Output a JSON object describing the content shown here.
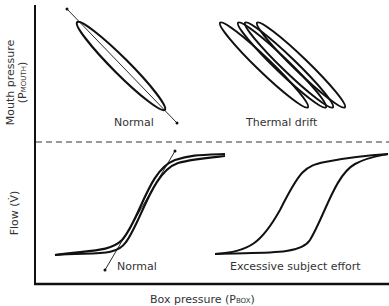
{
  "y_axis_top": {
    "label": "Mouth pressure",
    "symbol_main": "(P",
    "symbol_sub": "MOUTH",
    "symbol_end": ")"
  },
  "y_axis_bottom": {
    "label": "Flow (V̇)"
  },
  "x_axis": {
    "label_partial": "Box pressure",
    "symbol_main": "(P",
    "symbol_sub": "BOX",
    "symbol_end": ")"
  },
  "panels": {
    "top_left": {
      "caption": "Normal"
    },
    "top_right": {
      "caption": "Thermal drift"
    },
    "bottom_left": {
      "caption": "Normal"
    },
    "bottom_right": {
      "caption": "Excessive subject effort"
    }
  },
  "colors": {
    "line": "#111111",
    "text": "#333333"
  }
}
